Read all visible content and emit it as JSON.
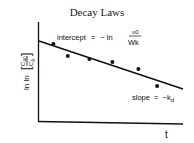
{
  "chart_data": {
    "type": "scatter",
    "title": "Decay Laws",
    "xlabel": "t",
    "ylabel": "ln ln [C_A0 / C_A]",
    "ylabel_parts": {
      "prefix": "ln ln",
      "numerator": "C",
      "numerator_sub": "A0",
      "denominator": "C",
      "denominator_sub": "A"
    },
    "grid": false,
    "legend": null,
    "points": [
      {
        "x": 1.0,
        "y": 7.8
      },
      {
        "x": 2.0,
        "y": 6.6
      },
      {
        "x": 3.5,
        "y": 6.3
      },
      {
        "x": 5.1,
        "y": 6.0
      },
      {
        "x": 6.9,
        "y": 5.3
      },
      {
        "x": 8.2,
        "y": 3.6
      }
    ],
    "fit_line": {
      "x": [
        0,
        9.9
      ],
      "y": [
        8.1,
        3.3
      ],
      "slope": -0.48,
      "intercept": 8.1
    },
    "annotations": [
      {
        "text": "intercept = − ln υ0 / Wk",
        "lhs": "intercept",
        "eq": "=",
        "minus": "− ln",
        "frac_num": "υ0",
        "frac_den": "Wk"
      },
      {
        "text": "slope = −k_d",
        "lhs": "slope",
        "eq": "=",
        "rhs": "−k",
        "rhs_sub": "d"
      }
    ],
    "xlim": [
      0,
      10
    ],
    "ylim": [
      0,
      10
    ]
  },
  "title": "Decay Laws",
  "axes": {
    "x_label": "t",
    "y_prefix": "ln ln",
    "y_num": "C",
    "y_num_sub": "A0",
    "y_den": "C",
    "y_den_sub": "A"
  },
  "annotation_intercept": {
    "lhs": "intercept",
    "eq": "=",
    "minus": "− ln",
    "num": "υ0",
    "den": "Wk"
  },
  "annotation_slope": {
    "lhs": "slope",
    "eq": "=",
    "rhs": "−k",
    "sub": "d"
  }
}
